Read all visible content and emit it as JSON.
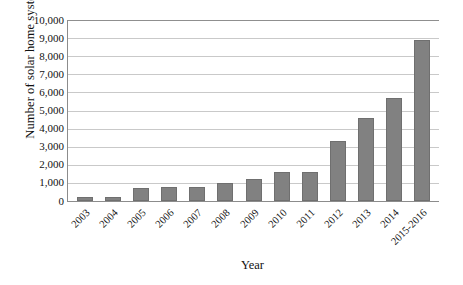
{
  "chart_data": {
    "type": "bar",
    "title": "",
    "xlabel": "Year",
    "ylabel": "Number of solar home systems",
    "categories": [
      "2003",
      "2004",
      "2005",
      "2006",
      "2007",
      "2008",
      "2009",
      "2010",
      "2011",
      "2012",
      "2013",
      "2014",
      "2015-2016"
    ],
    "values": [
      200,
      200,
      700,
      800,
      800,
      1000,
      1200,
      1600,
      1600,
      3300,
      4600,
      5700,
      8900
    ],
    "ylim": [
      0,
      10000
    ],
    "y_ticks": [
      0,
      1000,
      2000,
      3000,
      4000,
      5000,
      6000,
      7000,
      8000,
      9000,
      10000
    ],
    "y_tick_labels": [
      "0",
      "1,000",
      "2,000",
      "3,000",
      "4,000",
      "5,000",
      "6,000",
      "7,000",
      "8,000",
      "9,000",
      "10,000"
    ],
    "grid": true,
    "legend": false,
    "bar_color": "#818181",
    "gridline_color": "#c9c9c9",
    "axis_color": "#8c8c8c"
  }
}
